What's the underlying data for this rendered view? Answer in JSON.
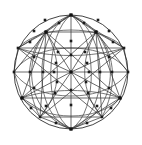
{
  "figure": {
    "canvas": {
      "width": 142,
      "height": 145,
      "background": "#ffffff"
    },
    "colors": {
      "background": "#ffffff",
      "line": "#3a3a3a",
      "arc": "#4a4a4a",
      "boundary": "#2e2e2e",
      "node": "#1c1c1c",
      "hub": "#121212"
    },
    "geometry": {
      "center": {
        "x": 71,
        "y": 72
      },
      "radius": 57,
      "boundary_stroke_width": 0.9,
      "edge_stroke_width": 0.75,
      "node_size": 2.6,
      "hub_size": 3.2
    },
    "labels": {
      "boundary": "outer-circle",
      "center_node": "center-hub",
      "top_node": "north-pole-hub",
      "bottom_node": "south-pole-hub",
      "left_node": "west-hub",
      "right_node": "east-hub"
    },
    "counts": {
      "hubs": 7,
      "nodes": 48,
      "straight_edges": 40,
      "arc_edges": 16
    }
  },
  "hubs": [
    {
      "name": "center-hub",
      "x": 71,
      "y": 72
    },
    {
      "name": "north-pole-hub",
      "x": 71,
      "y": 15
    },
    {
      "name": "south-pole-hub",
      "x": 71,
      "y": 129
    },
    {
      "name": "west-hub",
      "x": 22,
      "y": 98
    },
    {
      "name": "east-hub",
      "x": 120,
      "y": 98
    },
    {
      "name": "northwest-hub",
      "x": 46,
      "y": 32
    },
    {
      "name": "northeast-hub",
      "x": 96,
      "y": 32
    }
  ],
  "straight_edges": [
    {
      "x1": 71,
      "y1": 15,
      "x2": 71,
      "y2": 129
    },
    {
      "x1": 14,
      "y1": 72,
      "x2": 128,
      "y2": 72
    },
    {
      "x1": 71,
      "y1": 72,
      "x2": 46,
      "y2": 32
    },
    {
      "x1": 71,
      "y1": 72,
      "x2": 96,
      "y2": 32
    },
    {
      "x1": 71,
      "y1": 72,
      "x2": 22,
      "y2": 98
    },
    {
      "x1": 71,
      "y1": 72,
      "x2": 120,
      "y2": 98
    },
    {
      "x1": 71,
      "y1": 72,
      "x2": 40,
      "y2": 117
    },
    {
      "x1": 71,
      "y1": 72,
      "x2": 102,
      "y2": 117
    },
    {
      "x1": 71,
      "y1": 72,
      "x2": 18,
      "y2": 48
    },
    {
      "x1": 71,
      "y1": 72,
      "x2": 124,
      "y2": 48
    },
    {
      "x1": 46,
      "y1": 32,
      "x2": 96,
      "y2": 32
    },
    {
      "x1": 46,
      "y1": 32,
      "x2": 71,
      "y2": 15
    },
    {
      "x1": 96,
      "y1": 32,
      "x2": 71,
      "y2": 15
    },
    {
      "x1": 46,
      "y1": 32,
      "x2": 22,
      "y2": 98
    },
    {
      "x1": 96,
      "y1": 32,
      "x2": 120,
      "y2": 98
    },
    {
      "x1": 46,
      "y1": 32,
      "x2": 120,
      "y2": 98
    },
    {
      "x1": 96,
      "y1": 32,
      "x2": 22,
      "y2": 98
    },
    {
      "x1": 46,
      "y1": 32,
      "x2": 14,
      "y2": 72
    },
    {
      "x1": 96,
      "y1": 32,
      "x2": 128,
      "y2": 72
    },
    {
      "x1": 46,
      "y1": 32,
      "x2": 18,
      "y2": 48
    },
    {
      "x1": 96,
      "y1": 32,
      "x2": 124,
      "y2": 48
    },
    {
      "x1": 22,
      "y1": 98,
      "x2": 120,
      "y2": 98
    },
    {
      "x1": 22,
      "y1": 98,
      "x2": 71,
      "y2": 129
    },
    {
      "x1": 120,
      "y1": 98,
      "x2": 71,
      "y2": 129
    },
    {
      "x1": 22,
      "y1": 98,
      "x2": 40,
      "y2": 117
    },
    {
      "x1": 120,
      "y1": 98,
      "x2": 102,
      "y2": 117
    },
    {
      "x1": 22,
      "y1": 98,
      "x2": 14,
      "y2": 72
    },
    {
      "x1": 120,
      "y1": 98,
      "x2": 128,
      "y2": 72
    },
    {
      "x1": 40,
      "y1": 117,
      "x2": 71,
      "y2": 129
    },
    {
      "x1": 102,
      "y1": 117,
      "x2": 71,
      "y2": 129
    },
    {
      "x1": 40,
      "y1": 117,
      "x2": 102,
      "y2": 117
    },
    {
      "x1": 18,
      "y1": 48,
      "x2": 71,
      "y2": 15
    },
    {
      "x1": 124,
      "y1": 48,
      "x2": 71,
      "y2": 15
    },
    {
      "x1": 18,
      "y1": 48,
      "x2": 14,
      "y2": 72
    },
    {
      "x1": 124,
      "y1": 48,
      "x2": 128,
      "y2": 72
    },
    {
      "x1": 46,
      "y1": 32,
      "x2": 40,
      "y2": 117
    },
    {
      "x1": 96,
      "y1": 32,
      "x2": 102,
      "y2": 117
    },
    {
      "x1": 18,
      "y1": 48,
      "x2": 124,
      "y2": 48
    },
    {
      "x1": 40,
      "y1": 117,
      "x2": 124,
      "y2": 48
    },
    {
      "x1": 102,
      "y1": 117,
      "x2": 18,
      "y2": 48
    }
  ],
  "arc_edges": [
    {
      "name": "meridian-1",
      "d": "M 71 15 C 34 30, 30 114, 71 129"
    },
    {
      "name": "meridian-2",
      "d": "M 71 15 C 108 30, 112 114, 71 129"
    },
    {
      "name": "meridian-3",
      "d": "M 71 15 C 46 32, 42 112, 71 129"
    },
    {
      "name": "meridian-4",
      "d": "M 71 15 C 96 32, 100 112, 71 129"
    },
    {
      "name": "meridian-5",
      "d": "M 71 15 C 20 34, 17 110, 71 129"
    },
    {
      "name": "meridian-6",
      "d": "M 71 15 C 122 34, 125 110, 71 129"
    },
    {
      "name": "parallel-1",
      "d": "M 14 72 C 34 40, 108 40, 128 72"
    },
    {
      "name": "parallel-2",
      "d": "M 14 72 C 34 104, 108 104, 128 72"
    },
    {
      "name": "parallel-3",
      "d": "M 18 48 C 40 24, 102 24, 124 48"
    },
    {
      "name": "parallel-4",
      "d": "M 22 98 C 42 122, 100 122, 120 98"
    },
    {
      "name": "diag-arc-1",
      "d": "M 46 32 C 24 56, 26 90, 40 117"
    },
    {
      "name": "diag-arc-2",
      "d": "M 96 32 C 118 56, 116 90, 102 117"
    },
    {
      "name": "diag-arc-3",
      "d": "M 18 48 C 48 58, 92 58, 124 48"
    },
    {
      "name": "diag-arc-4",
      "d": "M 22 98 C 50 88, 92 88, 120 98"
    },
    {
      "name": "diag-arc-5",
      "d": "M 46 32 C 62 60, 62 92, 40 117"
    },
    {
      "name": "diag-arc-6",
      "d": "M 96 32 C 80 60, 80 92, 102 117"
    }
  ],
  "nodes": [
    {
      "x": 71,
      "y": 15
    },
    {
      "x": 71,
      "y": 129
    },
    {
      "x": 14,
      "y": 72
    },
    {
      "x": 128,
      "y": 72
    },
    {
      "x": 46,
      "y": 32
    },
    {
      "x": 96,
      "y": 32
    },
    {
      "x": 22,
      "y": 98
    },
    {
      "x": 120,
      "y": 98
    },
    {
      "x": 40,
      "y": 117
    },
    {
      "x": 102,
      "y": 117
    },
    {
      "x": 18,
      "y": 48
    },
    {
      "x": 124,
      "y": 48
    },
    {
      "x": 59,
      "y": 23
    },
    {
      "x": 84,
      "y": 23
    },
    {
      "x": 45,
      "y": 20
    },
    {
      "x": 98,
      "y": 20
    },
    {
      "x": 34,
      "y": 31
    },
    {
      "x": 109,
      "y": 31
    },
    {
      "x": 30,
      "y": 42
    },
    {
      "x": 113,
      "y": 42
    },
    {
      "x": 71,
      "y": 41
    },
    {
      "x": 71,
      "y": 55
    },
    {
      "x": 71,
      "y": 90
    },
    {
      "x": 71,
      "y": 105
    },
    {
      "x": 58,
      "y": 52
    },
    {
      "x": 85,
      "y": 52
    },
    {
      "x": 56,
      "y": 63
    },
    {
      "x": 87,
      "y": 63
    },
    {
      "x": 57,
      "y": 82
    },
    {
      "x": 86,
      "y": 82
    },
    {
      "x": 55,
      "y": 93
    },
    {
      "x": 88,
      "y": 93
    },
    {
      "x": 43,
      "y": 72
    },
    {
      "x": 100,
      "y": 72
    },
    {
      "x": 30,
      "y": 72
    },
    {
      "x": 112,
      "y": 72
    },
    {
      "x": 54,
      "y": 72
    },
    {
      "x": 89,
      "y": 72
    },
    {
      "x": 34,
      "y": 57
    },
    {
      "x": 109,
      "y": 57
    },
    {
      "x": 34,
      "y": 88
    },
    {
      "x": 109,
      "y": 88
    },
    {
      "x": 31,
      "y": 108
    },
    {
      "x": 111,
      "y": 108
    },
    {
      "x": 56,
      "y": 123
    },
    {
      "x": 87,
      "y": 123
    },
    {
      "x": 46,
      "y": 106
    },
    {
      "x": 97,
      "y": 106
    }
  ]
}
